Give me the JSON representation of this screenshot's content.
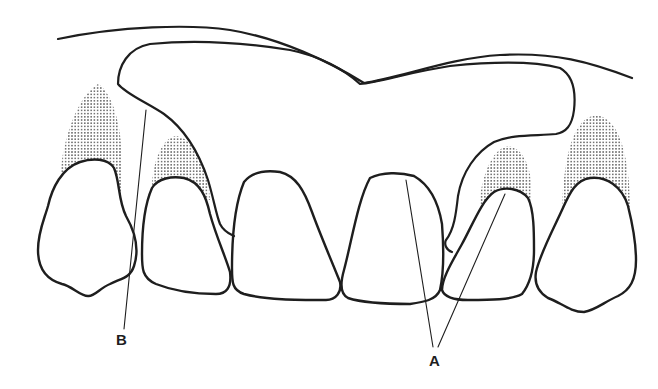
{
  "figure": {
    "colors": {
      "line": "#1e1e1e",
      "background": "#ffffff",
      "stipple": "#3a3a3a"
    },
    "labels": {
      "a": "A",
      "b": "B"
    },
    "parts": [
      {
        "id": "palate-outline",
        "name": "Palatal contour line"
      },
      {
        "id": "plate",
        "name": "Acrylic plate / denture base outline"
      },
      {
        "id": "tooth-1",
        "name": "Right canine"
      },
      {
        "id": "tooth-2",
        "name": "Right lateral incisor"
      },
      {
        "id": "tooth-3",
        "name": "Right central incisor"
      },
      {
        "id": "tooth-4",
        "name": "Left central incisor"
      },
      {
        "id": "tooth-5",
        "name": "Left lateral incisor"
      },
      {
        "id": "tooth-6",
        "name": "Left canine"
      },
      {
        "id": "gingiva-stipple",
        "name": "Stippled gingival areas"
      },
      {
        "id": "leader-a",
        "name": "Leader lines to label A (central and lateral incisors)"
      },
      {
        "id": "leader-b",
        "name": "Leader line to label B (plate margin)"
      }
    ]
  }
}
